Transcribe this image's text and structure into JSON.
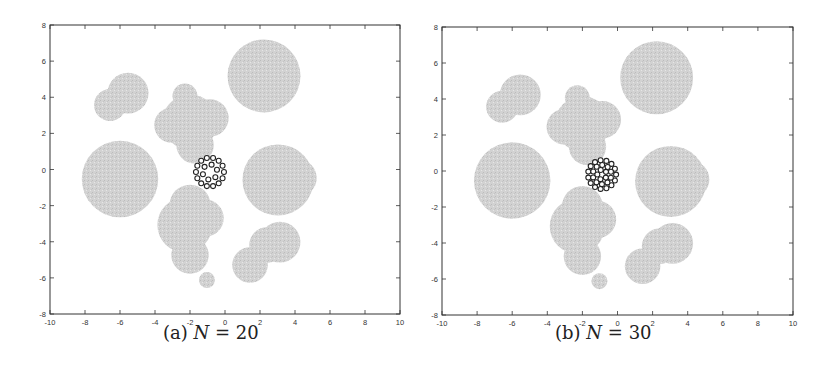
{
  "figure": {
    "panels": [
      {
        "id": "a",
        "caption_prefix": "(a)",
        "caption_var": "N",
        "caption_eq": "=",
        "caption_value": "20",
        "frame_px": {
          "left": 50,
          "top": 25,
          "right": 400,
          "bottom": 314
        }
      },
      {
        "id": "b",
        "caption_prefix": "(b)",
        "caption_var": "N",
        "caption_eq": "=",
        "caption_value": "30",
        "frame_px": {
          "left": 442,
          "top": 27,
          "right": 793,
          "bottom": 315
        }
      }
    ]
  },
  "chart_data": [
    {
      "type": "scatter",
      "title": "(a) N = 20",
      "xlabel": "",
      "ylabel": "",
      "xlim": [
        -10,
        10
      ],
      "ylim": [
        -8,
        8
      ],
      "xticks": [
        -10,
        -8,
        -6,
        -4,
        -2,
        0,
        2,
        4,
        6,
        8,
        10
      ],
      "yticks": [
        -8,
        -6,
        -4,
        -2,
        0,
        2,
        4,
        6,
        8
      ],
      "grid": false,
      "legend": null,
      "obstacle_color": "#d2d2d2",
      "robot_color": "#222222",
      "obstacles": [
        {
          "x": 2.23,
          "y": 5.18,
          "r": 2.05
        },
        {
          "x": -6.0,
          "y": -0.53,
          "r": 2.15
        },
        {
          "x": -5.54,
          "y": 4.23,
          "r": 1.15
        },
        {
          "x": -6.57,
          "y": 3.57,
          "r": 0.9
        },
        {
          "x": -2.29,
          "y": 4.07,
          "r": 0.7
        },
        {
          "x": -2.0,
          "y": 2.63,
          "r": 1.55
        },
        {
          "x": -0.86,
          "y": 2.85,
          "r": 1.05
        },
        {
          "x": -3.03,
          "y": 2.46,
          "r": 1.0
        },
        {
          "x": -1.71,
          "y": 1.36,
          "r": 1.05
        },
        {
          "x": 3.03,
          "y": -0.58,
          "r": 2.0
        },
        {
          "x": 4.17,
          "y": -0.47,
          "r": 1.05
        },
        {
          "x": -2.0,
          "y": -1.97,
          "r": 1.15
        },
        {
          "x": -2.29,
          "y": -3.07,
          "r": 1.55
        },
        {
          "x": -1.14,
          "y": -2.69,
          "r": 1.05
        },
        {
          "x": -2.0,
          "y": -4.74,
          "r": 1.05
        },
        {
          "x": -1.03,
          "y": -6.12,
          "r": 0.45
        },
        {
          "x": 3.14,
          "y": -4.02,
          "r": 1.15
        },
        {
          "x": 2.4,
          "y": -4.18,
          "r": 1.0
        },
        {
          "x": 1.43,
          "y": -5.29,
          "r": 1.0
        }
      ],
      "formation": {
        "N": 20,
        "center": {
          "x": -0.86,
          "y": -0.14
        },
        "robot_radius": 0.14,
        "rings": [
          {
            "count": 14,
            "radius": 0.8
          },
          {
            "count": 6,
            "radius": 0.42
          }
        ]
      }
    },
    {
      "type": "scatter",
      "title": "(b) N = 30",
      "xlabel": "",
      "ylabel": "",
      "xlim": [
        -10,
        10
      ],
      "ylim": [
        -8,
        8
      ],
      "xticks": [
        -10,
        -8,
        -6,
        -4,
        -2,
        0,
        2,
        4,
        6,
        8,
        10
      ],
      "yticks": [
        -8,
        -6,
        -4,
        -2,
        0,
        2,
        4,
        6,
        8
      ],
      "grid": false,
      "legend": null,
      "obstacle_color": "#d2d2d2",
      "robot_color": "#222222",
      "obstacles": "same as (a)",
      "formation": {
        "N": 30,
        "center": {
          "x": -0.88,
          "y": -0.2
        },
        "robot_radius": 0.14,
        "rings": [
          {
            "count": 15,
            "radius": 0.8
          },
          {
            "count": 10,
            "radius": 0.53
          },
          {
            "count": 5,
            "radius": 0.27
          }
        ]
      }
    }
  ]
}
